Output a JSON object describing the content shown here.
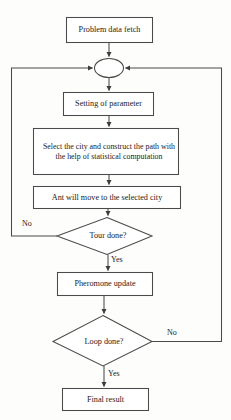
{
  "diagram": {
    "colors": {
      "background": "#fdfdfc",
      "stroke": "#4a4a4a",
      "text": "#1b1b1b",
      "fill": "#ffffff"
    },
    "nodes": [
      {
        "id": "start",
        "shape": "rectangle",
        "label": "Problem data fetch"
      },
      {
        "id": "merge",
        "shape": "ellipse",
        "label": ""
      },
      {
        "id": "setting",
        "shape": "rectangle",
        "label": "Setting of parameter"
      },
      {
        "id": "select",
        "shape": "rectangle",
        "label": "Select the city and construct the path with the help of statistical computation"
      },
      {
        "id": "move",
        "shape": "rectangle",
        "label": "Ant will move to the selected city"
      },
      {
        "id": "tour",
        "shape": "diamond",
        "label": "Tour done?"
      },
      {
        "id": "pheromone",
        "shape": "rectangle",
        "label": "Pheromone update"
      },
      {
        "id": "loop",
        "shape": "diamond",
        "label": "Loop done?"
      },
      {
        "id": "final",
        "shape": "rectangle",
        "label": "Final result"
      }
    ],
    "edge_labels": {
      "tour_no": "No",
      "tour_yes": "Yes",
      "loop_no": "No",
      "loop_yes": "Yes"
    }
  }
}
